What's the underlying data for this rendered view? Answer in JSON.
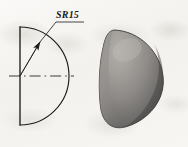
{
  "figure": {
    "background_color": "#f6f5f2",
    "line_color": "#1b1b1b",
    "views": [
      {
        "name": "orthographic-view",
        "description": "Half-section profile of a hemisphere: vertical flat edge on the left, semicircular arc on the right, dash-dot axis centerline.",
        "dimension_label": "SR15",
        "dimension_meaning": "Spherical Radius 15",
        "leader": {
          "arrow_tip_x": 40,
          "arrow_tip_y": 42,
          "elbow_x": 56,
          "elbow_y": 22,
          "shelf_end_x": 84,
          "shelf_end_y": 22
        },
        "geometry": {
          "vertical_edge_x": 20,
          "vertical_edge_top_y": 27,
          "vertical_edge_bottom_y": 125,
          "arc_radius": 49,
          "center_x": 20,
          "center_y": 76,
          "centerline_start_x": 9,
          "centerline_end_x": 74,
          "centerline_y": 76
        }
      },
      {
        "name": "pictorial-view",
        "description": "Shaded three-dimensional rendering of the hemisphere (dome) solid.",
        "shading": {
          "highlight_color": "#a9a6a2",
          "midtone_color": "#8e8b88",
          "shadow_color": "#4e4c4a",
          "edge_color": "#3b3a39"
        },
        "bounds": {
          "left_x": 101,
          "right_x": 164,
          "top_y": 30,
          "bottom_y": 128
        }
      }
    ]
  }
}
